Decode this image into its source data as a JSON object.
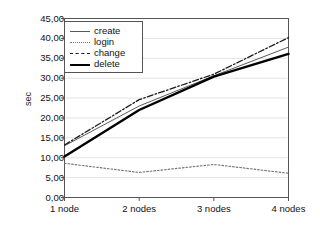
{
  "chart_data": {
    "type": "line",
    "title": "",
    "xlabel": "",
    "ylabel": "sec",
    "categories": [
      "1 node",
      "2 nodes",
      "3 nodes",
      "4 nodes"
    ],
    "ylim": [
      0,
      45
    ],
    "ytick_values": [
      0,
      5,
      10,
      15,
      20,
      25,
      30,
      35,
      40,
      45
    ],
    "ytick_labels": [
      "0,00",
      "5,00",
      "10,00",
      "15,00",
      "20,00",
      "25,00",
      "30,00",
      "35,00",
      "40,00",
      "45,00"
    ],
    "grid": "horizontal",
    "legend_position": "top-left-inside",
    "decimal_separator": ",",
    "series": [
      {
        "name": "create",
        "style": "thin-solid",
        "color": "#5a5a5a",
        "values": [
          13.0,
          23.0,
          30.6,
          37.8
        ]
      },
      {
        "name": "login",
        "style": "dotted",
        "color": "#7a7a7a",
        "values": [
          8.6,
          6.3,
          8.3,
          6.1
        ]
      },
      {
        "name": "change",
        "style": "dash-dot",
        "color": "#1a1a1a",
        "values": [
          13.2,
          24.6,
          31.0,
          40.2
        ]
      },
      {
        "name": "delete",
        "style": "thick-solid",
        "color": "#000000",
        "values": [
          10.3,
          22.0,
          30.4,
          36.1
        ]
      }
    ]
  },
  "legend": {
    "items": [
      {
        "label": "create"
      },
      {
        "label": "login"
      },
      {
        "label": "change"
      },
      {
        "label": "delete"
      }
    ]
  },
  "colors": {
    "axis": "#555555",
    "grid": "#e3e3e3",
    "background": "#ffffff",
    "text": "#111111"
  }
}
